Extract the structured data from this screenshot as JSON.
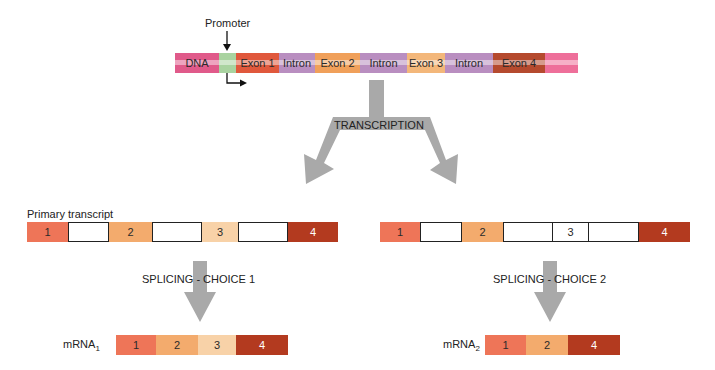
{
  "colors": {
    "dna": "#e05a8a",
    "promoter": "#a9d3a0",
    "exon1": "#e0583c",
    "intron": "#b98ec0",
    "exon2": "#f0a05a",
    "exon3": "#f3b77a",
    "exon4": "#b54a2e",
    "dna_end": "#ee6f9a",
    "t_exon1": "#ee7558",
    "t_exon2": "#f3ab6d",
    "t_exon3": "#f8d2a8",
    "t_exon4": "#b33a1f",
    "arrow": "#a9a9a9"
  },
  "gene": {
    "promoter_label": "Promoter",
    "segments": [
      {
        "label": "DNA",
        "type": "dna"
      },
      {
        "label": "",
        "type": "promoter"
      },
      {
        "label": "Exon 1",
        "type": "exon1"
      },
      {
        "label": "Intron",
        "type": "intron"
      },
      {
        "label": "Exon 2",
        "type": "exon2"
      },
      {
        "label": "Intron",
        "type": "intron"
      },
      {
        "label": "Exon 3",
        "type": "exon3"
      },
      {
        "label": "Intron",
        "type": "intron"
      },
      {
        "label": "Exon 4",
        "type": "exon4"
      },
      {
        "label": "",
        "type": "dna_end"
      }
    ]
  },
  "transcription": {
    "label": "TRANSCRIPTION"
  },
  "primary_transcript": {
    "title": "Primary transcript",
    "left": [
      "1",
      "",
      "2",
      "",
      "3",
      "",
      "4"
    ],
    "right": [
      "1",
      "",
      "2",
      "",
      "3",
      "",
      "4"
    ]
  },
  "splicing": {
    "choice1": "SPLICING - CHOICE 1",
    "choice2": "SPLICING - CHOICE 2"
  },
  "mrna1": {
    "label": "mRNA",
    "subscript": "1",
    "exons": [
      "1",
      "2",
      "3",
      "4"
    ]
  },
  "mrna2": {
    "label": "mRNA",
    "subscript": "2",
    "exons": [
      "1",
      "2",
      "4"
    ]
  }
}
